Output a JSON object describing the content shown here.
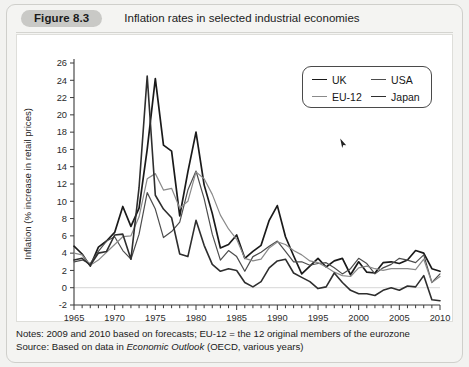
{
  "figure": {
    "badge": "Figure 8.3",
    "title": "Inflation rates in selected industrial economies"
  },
  "notes": {
    "line1_prefix": "Notes: 2009 and 2010 based on forecasts; EU-12 = the 12 original members of the eurozone",
    "line2_prefix": "Source: Based on data in ",
    "line2_em": "Economic Outlook",
    "line2_suffix": " (OECD, various years)"
  },
  "legend": {
    "entries": [
      {
        "label": "UK",
        "color": "#1a1a1a",
        "width": 1.7
      },
      {
        "label": "USA",
        "color": "#4d4d4d",
        "width": 1.2
      },
      {
        "label": "EU-12",
        "color": "#8a8a8a",
        "width": 1.2
      },
      {
        "label": "Japan",
        "color": "#2e2e2e",
        "width": 1.6
      }
    ]
  },
  "chart_data": {
    "type": "line",
    "title": "Inflation rates in selected industrial economies",
    "xlabel": "",
    "ylabel": "Inflation (% increase in retail prices)",
    "xlim": [
      1965,
      2010
    ],
    "ylim": [
      -2,
      26
    ],
    "ytick_step": 2,
    "xtick_step": 5,
    "x_minor_step": 1,
    "grid": false,
    "zero_line": true,
    "legend_position": "top-right",
    "yticks": [
      -2,
      0,
      2,
      4,
      6,
      8,
      10,
      12,
      14,
      16,
      18,
      20,
      22,
      24,
      26
    ],
    "xticks": [
      1965,
      1970,
      1975,
      1980,
      1985,
      1990,
      1995,
      2000,
      2005,
      2010
    ],
    "x": [
      1965,
      1966,
      1967,
      1968,
      1969,
      1970,
      1971,
      1972,
      1973,
      1974,
      1975,
      1976,
      1977,
      1978,
      1979,
      1980,
      1981,
      1982,
      1983,
      1984,
      1985,
      1986,
      1987,
      1988,
      1989,
      1990,
      1991,
      1992,
      1993,
      1994,
      1995,
      1996,
      1997,
      1998,
      1999,
      2000,
      2001,
      2002,
      2003,
      2004,
      2005,
      2006,
      2007,
      2008,
      2009,
      2010
    ],
    "series": [
      {
        "name": "UK",
        "color": "#1a1a1a",
        "width": 1.7,
        "values": [
          4.8,
          3.9,
          2.5,
          4.7,
          5.4,
          6.4,
          9.4,
          7.1,
          9.2,
          16.0,
          24.2,
          16.5,
          15.8,
          8.3,
          13.4,
          18.0,
          11.9,
          8.6,
          4.6,
          5.0,
          6.1,
          3.4,
          4.2,
          4.9,
          7.8,
          9.5,
          5.9,
          3.7,
          1.6,
          2.5,
          3.4,
          2.4,
          3.1,
          3.4,
          1.5,
          3.0,
          1.8,
          1.7,
          2.9,
          3.0,
          2.8,
          3.2,
          4.3,
          4.0,
          2.2,
          1.9
        ]
      },
      {
        "name": "USA",
        "color": "#4d4d4d",
        "width": 1.2,
        "values": [
          3.0,
          3.2,
          2.8,
          4.2,
          5.4,
          5.9,
          4.3,
          3.3,
          6.2,
          11.0,
          9.1,
          5.8,
          6.5,
          7.6,
          11.3,
          13.5,
          10.3,
          6.2,
          3.2,
          4.3,
          3.6,
          1.9,
          3.6,
          4.1,
          4.8,
          5.4,
          4.2,
          3.0,
          3.0,
          2.6,
          2.8,
          2.9,
          2.3,
          1.6,
          2.2,
          3.4,
          2.8,
          1.6,
          2.3,
          2.7,
          3.4,
          3.2,
          2.9,
          3.8,
          0.6,
          1.6
        ]
      },
      {
        "name": "EU-12",
        "color": "#8a8a8a",
        "width": 1.2,
        "values": [
          4.0,
          3.8,
          2.6,
          3.2,
          4.1,
          5.0,
          5.9,
          6.0,
          8.2,
          12.6,
          13.2,
          11.3,
          11.5,
          9.2,
          10.0,
          13.4,
          12.6,
          10.8,
          8.4,
          6.8,
          5.6,
          3.4,
          3.1,
          3.3,
          4.6,
          5.3,
          5.0,
          4.3,
          3.8,
          3.1,
          2.9,
          2.4,
          1.8,
          1.4,
          1.3,
          2.3,
          2.5,
          2.2,
          2.0,
          2.2,
          2.2,
          2.2,
          2.1,
          3.3,
          0.6,
          1.3
        ]
      },
      {
        "name": "Japan",
        "color": "#2e2e2e",
        "width": 1.6,
        "values": [
          3.2,
          3.4,
          2.6,
          4.0,
          4.2,
          6.1,
          6.2,
          3.3,
          11.6,
          24.5,
          10.7,
          9.1,
          8.1,
          3.9,
          3.6,
          7.8,
          4.9,
          2.7,
          1.9,
          2.2,
          2.0,
          0.6,
          0.1,
          0.7,
          2.3,
          3.1,
          3.3,
          1.7,
          1.2,
          0.7,
          -0.1,
          0.1,
          1.7,
          0.6,
          -0.3,
          -0.7,
          -0.7,
          -0.9,
          -0.3,
          0.0,
          -0.3,
          0.2,
          0.1,
          1.4,
          -1.4,
          -1.5
        ]
      }
    ]
  }
}
